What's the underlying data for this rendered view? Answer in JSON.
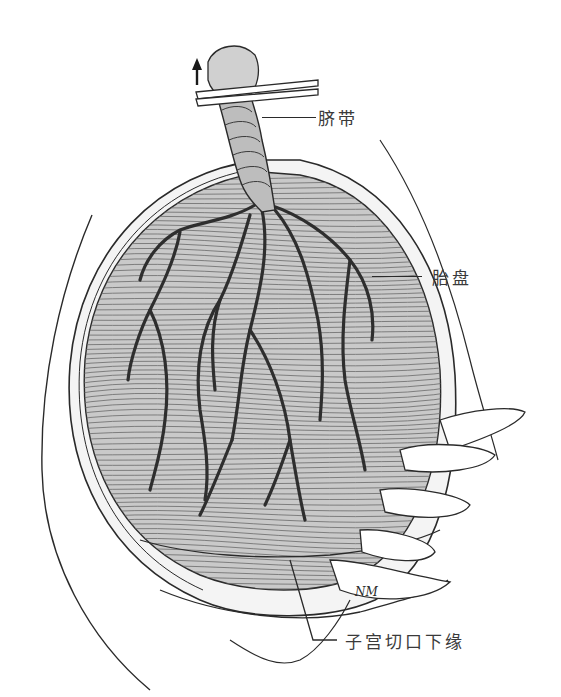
{
  "figure": {
    "colors": {
      "ink": "#2a2a2a",
      "hatch": "#6a6a6a",
      "placenta_fill": "#c9c9c9",
      "background": "#ffffff"
    },
    "labels": {
      "umbilical_cord": "脐带",
      "placenta": "胎盘",
      "lower_incision_edge": "子宫切口下缘"
    },
    "signature": "NM",
    "arrow": "up-arrow"
  }
}
